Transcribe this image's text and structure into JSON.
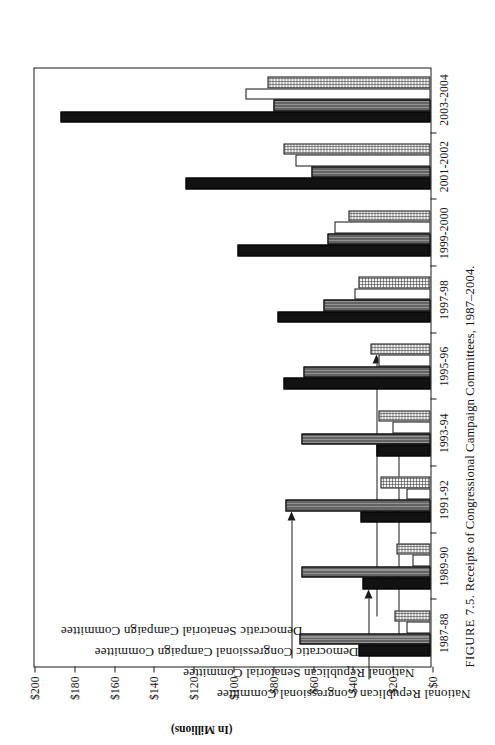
{
  "figure": {
    "number_label": "FIGURE 7.5.",
    "caption_text": "Receipts of Congressional Campaign Committees, 1987–2004.",
    "full_caption": "FIGURE 7.5.  Receipts of Congressional Campaign Committees, 1987–2004."
  },
  "axis": {
    "value_axis_title": "(In Millions)",
    "value_ticks": [
      "$200",
      "$180",
      "$160",
      "$140",
      "$120",
      "$100",
      "$80",
      "$60",
      "$40",
      "$20",
      "$0"
    ],
    "value_tick_numbers": [
      200,
      180,
      160,
      140,
      120,
      100,
      80,
      60,
      40,
      20,
      0
    ]
  },
  "callouts": [
    {
      "id": "nrcc",
      "label": "National Republican Congressional Committee",
      "points_to": "1989-90"
    },
    {
      "id": "nrsc",
      "label": "National Republican Senatorial Committee",
      "points_to": "1991-92"
    },
    {
      "id": "dccc",
      "label": "Democratic Congressional Campaign Committee",
      "points_to": "1993-94"
    },
    {
      "id": "dscc",
      "label": "Democratic Senatorial Campaign Committee",
      "points_to": "1995-96"
    }
  ],
  "chart_data": {
    "type": "bar",
    "title": "Receipts of Congressional Campaign Committees, 1987–2004",
    "subtitle": "",
    "orientation": "vertical-grouped (figure printed rotated 90°)",
    "xlabel": "",
    "ylabel": "(In Millions)",
    "ylim": [
      0,
      200
    ],
    "ytick_step": 20,
    "grid": false,
    "legend": "callout-arrows (no legend box)",
    "units": "millions of US dollars",
    "categories": [
      "1987-88",
      "1989-90",
      "1991-92",
      "1993-94",
      "1995-96",
      "1997-98",
      "1999-2000",
      "2001-2002",
      "2003-2004"
    ],
    "series": [
      {
        "name": "National Republican Congressional Committee",
        "short": "NRCC",
        "pattern": "solid-black",
        "color": "#121212",
        "values": [
          36,
          34,
          35,
          27,
          74,
          77,
          97,
          123,
          186
        ]
      },
      {
        "name": "National Republican Senatorial Committee",
        "short": "NRSC",
        "pattern": "dark-hatch",
        "color": "#2a2a2a",
        "values": [
          66,
          65,
          73,
          65,
          64,
          54,
          52,
          60,
          79
        ]
      },
      {
        "name": "Democratic Congressional Campaign Committee",
        "short": "DCCC",
        "pattern": "open-white",
        "color": "#ffffff",
        "values": [
          12,
          9,
          12,
          19,
          26,
          38,
          48,
          68,
          93
        ]
      },
      {
        "name": "Democratic Senatorial Campaign Committee",
        "short": "DSCC",
        "pattern": "light-stipple",
        "color": "#f1f1f1",
        "values": [
          18,
          17,
          25,
          26,
          30,
          36,
          41,
          74,
          82
        ]
      }
    ]
  }
}
